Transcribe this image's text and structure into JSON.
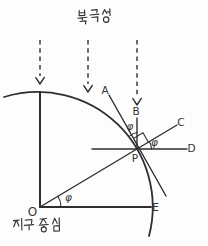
{
  "diagram": {
    "origin_caption": "지구 중심",
    "angle_symbol": "φ",
    "points": {
      "A": "A",
      "B": "B",
      "C": "C",
      "D": "D",
      "E": "E",
      "O": "O",
      "P": "P"
    }
  },
  "colors": {
    "stroke": "#2e2e2e",
    "label": "#333333",
    "background": "#fdfdfd"
  }
}
